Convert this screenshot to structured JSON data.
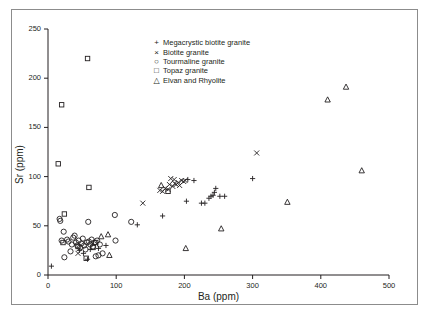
{
  "chart_data": {
    "type": "scatter",
    "title": "",
    "xlabel": "Ba (ppm)",
    "ylabel": "Sr (ppm)",
    "xlim": [
      0,
      500
    ],
    "ylim": [
      0,
      250
    ],
    "xticks": [
      0,
      100,
      200,
      300,
      400,
      500
    ],
    "yticks": [
      0,
      50,
      100,
      150,
      200,
      250
    ],
    "xtick_labels": [
      "0",
      "100",
      "200",
      "300",
      "400",
      "500"
    ],
    "ytick_labels": [
      "0",
      "50",
      "100",
      "150",
      "200",
      "250"
    ],
    "grid": false,
    "legend_position": "top-center",
    "series": [
      {
        "name": "Megacrystic biotite granite",
        "marker": "plus",
        "points": [
          [
            5,
            9
          ],
          [
            58,
            16
          ],
          [
            62,
            26
          ],
          [
            74,
            27
          ],
          [
            85,
            30
          ],
          [
            46,
            25
          ],
          [
            52,
            22
          ],
          [
            131,
            51
          ],
          [
            168,
            60
          ],
          [
            203,
            75
          ],
          [
            225,
            73
          ],
          [
            230,
            73
          ],
          [
            236,
            78
          ],
          [
            239,
            80
          ],
          [
            242,
            81
          ],
          [
            244,
            84
          ],
          [
            246,
            88
          ],
          [
            252,
            80
          ],
          [
            259,
            80
          ],
          [
            205,
            97
          ],
          [
            214,
            96
          ],
          [
            300,
            98
          ]
        ]
      },
      {
        "name": "Biotite granite",
        "marker": "cross",
        "points": [
          [
            44,
            22
          ],
          [
            139,
            73
          ],
          [
            164,
            86
          ],
          [
            168,
            85
          ],
          [
            172,
            88
          ],
          [
            176,
            87
          ],
          [
            178,
            92
          ],
          [
            180,
            98
          ],
          [
            183,
            90
          ],
          [
            185,
            97
          ],
          [
            186,
            93
          ],
          [
            188,
            92
          ],
          [
            191,
            94
          ],
          [
            193,
            91
          ],
          [
            196,
            96
          ],
          [
            199,
            95
          ],
          [
            201,
            96
          ],
          [
            306,
            124
          ]
        ]
      },
      {
        "name": "Tourmaline granite",
        "marker": "circle",
        "points": [
          [
            17,
            57
          ],
          [
            18,
            55
          ],
          [
            20,
            35
          ],
          [
            23,
            44
          ],
          [
            24,
            18
          ],
          [
            28,
            36
          ],
          [
            30,
            34
          ],
          [
            33,
            24
          ],
          [
            35,
            31
          ],
          [
            37,
            38
          ],
          [
            39,
            40
          ],
          [
            41,
            33
          ],
          [
            43,
            30
          ],
          [
            45,
            35
          ],
          [
            47,
            28
          ],
          [
            49,
            32
          ],
          [
            51,
            37
          ],
          [
            53,
            30
          ],
          [
            55,
            26
          ],
          [
            57,
            33
          ],
          [
            59,
            54
          ],
          [
            60,
            34
          ],
          [
            62,
            31
          ],
          [
            64,
            36
          ],
          [
            66,
            29
          ],
          [
            68,
            33
          ],
          [
            70,
            19
          ],
          [
            72,
            35
          ],
          [
            74,
            20
          ],
          [
            76,
            31
          ],
          [
            80,
            22
          ],
          [
            98,
            61
          ],
          [
            99,
            35
          ],
          [
            122,
            54
          ]
        ]
      },
      {
        "name": "Topaz granite",
        "marker": "square",
        "points": [
          [
            15,
            113
          ],
          [
            20,
            173
          ],
          [
            22,
            33
          ],
          [
            24,
            62
          ],
          [
            44,
            29
          ],
          [
            56,
            17
          ],
          [
            58,
            220
          ],
          [
            60,
            89
          ],
          [
            66,
            28
          ],
          [
            70,
            33
          ],
          [
            176,
            85
          ]
        ]
      },
      {
        "name": "Elvan and Rhyolite",
        "marker": "triangle",
        "points": [
          [
            78,
            39
          ],
          [
            88,
            41
          ],
          [
            90,
            20
          ],
          [
            166,
            91
          ],
          [
            202,
            27
          ],
          [
            254,
            47
          ],
          [
            351,
            74
          ],
          [
            410,
            178
          ],
          [
            437,
            191
          ],
          [
            460,
            106
          ]
        ]
      }
    ]
  },
  "legend": {
    "entries": [
      {
        "marker": "+",
        "label": "Megacrystic biotite granite"
      },
      {
        "marker": "×",
        "label": "Biotite granite"
      },
      {
        "marker": "○",
        "label": "Tourmaline granite"
      },
      {
        "marker": "□",
        "label": "Topaz granite"
      },
      {
        "marker": "△",
        "label": "Elvan and Rhyolite"
      }
    ]
  },
  "colors": {
    "marker": "#231f20",
    "axis": "#231f20",
    "frame": "#8c8c8c",
    "background": "#ffffff"
  }
}
